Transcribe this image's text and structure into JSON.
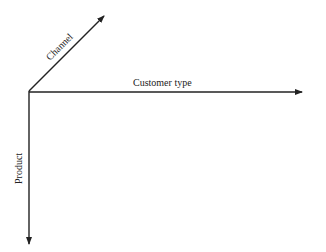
{
  "diagram": {
    "axes": [
      {
        "id": "channel",
        "label": "Channel",
        "direction": "diagonal-up-right"
      },
      {
        "id": "customer_type",
        "label": "Customer type",
        "direction": "right"
      },
      {
        "id": "product",
        "label": "Product",
        "direction": "down"
      }
    ],
    "colors": {
      "line": "#222222",
      "background": "#ffffff"
    }
  }
}
